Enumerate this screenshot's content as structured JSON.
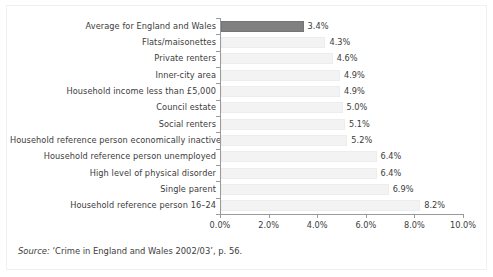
{
  "chart_data": {
    "type": "bar",
    "orientation": "horizontal",
    "title": "",
    "subtitle": "",
    "xlabel": "",
    "ylabel": "",
    "xlim": [
      0,
      10
    ],
    "grid": false,
    "legend": null,
    "axis_tick_labels": [
      "0.0%",
      "2.0%",
      "4.0%",
      "6.0%",
      "8.0%",
      "10.0%"
    ],
    "axis_tick_values": [
      0,
      2,
      4,
      6,
      8,
      10
    ],
    "categories": [
      "Average for England and Wales",
      "Flats/maisonettes",
      "Private renters",
      "Inner-city area",
      "Household income less than £5,000",
      "Council estate",
      "Social renters",
      "Household reference person economically inactive",
      "Household reference person unemployed",
      "High level of physical disorder",
      "Single parent",
      "Household reference person 16–24"
    ],
    "values": [
      3.4,
      4.3,
      4.6,
      4.9,
      4.9,
      5.0,
      5.1,
      5.2,
      6.4,
      6.4,
      6.9,
      8.2
    ],
    "value_labels": [
      "3.4%",
      "4.3%",
      "4.6%",
      "4.9%",
      "4.9%",
      "5.0%",
      "5.1%",
      "5.2%",
      "6.4%",
      "6.4%",
      "6.9%",
      "8.2%"
    ],
    "highlight_index": 0,
    "colors": {
      "highlight_bar": "#808080",
      "bar": "#f3f3f3",
      "bar_border": "#ededed",
      "axis": "#9a9a9a",
      "text": "#3c3c3c",
      "frame": "#f0f0f0",
      "background": "#ffffff"
    }
  },
  "source": {
    "label": "Source:",
    "text": "‘Crime in England and Wales 2002/03’, p. 56."
  }
}
